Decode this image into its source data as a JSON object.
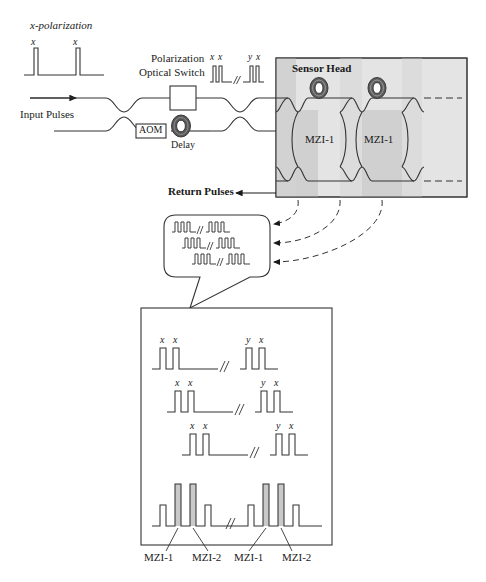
{
  "figure": {
    "title_labels": {
      "polarization": "x-polarization",
      "input_pulses": "Input Pulses",
      "switch_line1": "Polarization",
      "switch_line2": "Optical Switch",
      "aom": "AOM",
      "delay": "Delay",
      "sensor_head": "Sensor Head",
      "return_pulses": "Return Pulses"
    },
    "input_pulse_labels": [
      "x",
      "x"
    ],
    "switch_output_groups": [
      {
        "labels": [
          "x",
          "x"
        ]
      },
      {
        "labels": [
          "y",
          "x"
        ]
      }
    ],
    "sensor_head": {
      "mzi_labels": [
        "MZI-1",
        "MZI-1"
      ],
      "coil_count": 2,
      "coupler_rows": 2,
      "continues_dashed": true
    },
    "return_bubble": {
      "trace_rows": 3,
      "pulses_per_group": 3,
      "break_symbol": "\\\\"
    },
    "detail_panel": {
      "traces": [
        {
          "left_labels": [
            "x",
            "x"
          ],
          "right_labels": [
            "y",
            "x"
          ]
        },
        {
          "left_labels": [
            "x",
            "x"
          ],
          "right_labels": [
            "y",
            "x"
          ]
        },
        {
          "left_labels": [
            "x",
            "x"
          ],
          "right_labels": [
            "y",
            "x"
          ]
        }
      ],
      "combined_trace": {
        "shaded_pulse_labels": [
          "MZI-1",
          "MZI-2",
          "MZI-1",
          "MZI-2"
        ],
        "groups": 2,
        "pulses_per_group": 4
      }
    }
  },
  "colors": {
    "ink": "#1a1a1a",
    "line": "#333333",
    "panel_fill": "#ffffff",
    "sensor_fill": "#e3e3e3",
    "sensor_band": "#cfcfcf",
    "pulse_shade": "#c9c9c9",
    "coil_dark": "#4a4a4a"
  }
}
